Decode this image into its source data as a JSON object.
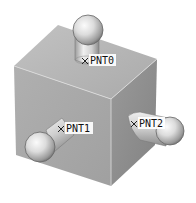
{
  "figure": {
    "colors": {
      "background": "#ffffff",
      "top_face": "#b4b4b4",
      "left_face": "#a6a6a6",
      "right_face": "#8e8e8e",
      "edge_highlight": "#d8d8d8",
      "sphere_light": "#f4f4f4",
      "sphere_dark": "#8a8a8a"
    },
    "points": [
      {
        "id": "pnt0",
        "label": "PNT0"
      },
      {
        "id": "pnt1",
        "label": "PNT1"
      },
      {
        "id": "pnt2",
        "label": "PNT2"
      }
    ]
  }
}
